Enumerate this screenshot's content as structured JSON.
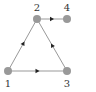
{
  "diagram": {
    "type": "directed-graph",
    "node_color": "#999999",
    "edge_color": "#999999",
    "arrow_color": "#222222",
    "label_color": "#333333",
    "nodes": [
      {
        "id": "1",
        "label": "1",
        "x": 8,
        "y": 71,
        "label_x": 8,
        "label_y": 87
      },
      {
        "id": "2",
        "label": "2",
        "x": 37,
        "y": 19,
        "label_x": 37,
        "label_y": 11
      },
      {
        "id": "3",
        "label": "3",
        "x": 67,
        "y": 71,
        "label_x": 67,
        "label_y": 87
      },
      {
        "id": "4",
        "label": "4",
        "x": 67,
        "y": 19,
        "label_x": 67,
        "label_y": 11
      }
    ],
    "edges": [
      {
        "from": "1",
        "to": "2"
      },
      {
        "from": "1",
        "to": "3"
      },
      {
        "from": "3",
        "to": "2"
      },
      {
        "from": "2",
        "to": "4"
      }
    ]
  }
}
